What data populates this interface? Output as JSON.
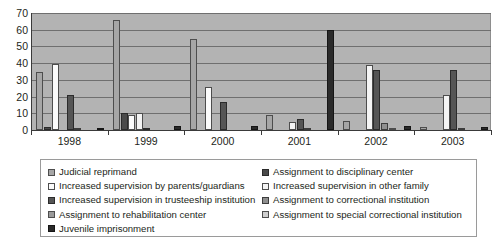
{
  "chart_data": {
    "type": "bar",
    "title": "",
    "subtitle": "",
    "xlabel": "",
    "ylabel": "",
    "ylim": [
      0,
      70
    ],
    "yticks": [
      0,
      10,
      20,
      30,
      40,
      50,
      60,
      70
    ],
    "grid": true,
    "legend_position": "bottom",
    "categories": [
      "1998",
      "1999",
      "2000",
      "2001",
      "2002",
      "2003"
    ],
    "series": [
      {
        "name": "Judicial reprimand",
        "color": "#a6a6a6",
        "values": [
          35,
          66,
          54.5,
          9,
          5.5,
          2
        ]
      },
      {
        "name": "Assignment to disciplinary center",
        "color": "#4a4a4a",
        "values": [
          2,
          10.2,
          0,
          0,
          0,
          0
        ]
      },
      {
        "name": "Increased supervision by parents/guardians",
        "color": "#fbfbfb",
        "values": [
          39.2,
          9,
          25.5,
          0,
          0,
          0
        ]
      },
      {
        "name": "Increased supervision in other family",
        "color": "#f4f4f4",
        "values": [
          0,
          10,
          0,
          5,
          39,
          21
        ]
      },
      {
        "name": "Increased supervision in trusteeship institution",
        "color": "#555555",
        "values": [
          21.2,
          1,
          16.5,
          6.5,
          36,
          36
        ]
      },
      {
        "name": "Assignment to correctional institution",
        "color": "#8f8f8f",
        "values": [
          0.5,
          0,
          0,
          1.5,
          4,
          0.5
        ]
      },
      {
        "name": "Assignment to rehabilitation center",
        "color": "#9a9a9a",
        "values": [
          0,
          0,
          0,
          0,
          1,
          0
        ]
      },
      {
        "name": "Assignment to special correctional institution",
        "color": "#cfcfcf",
        "values": [
          0,
          0,
          0,
          0,
          0,
          0
        ]
      },
      {
        "name": "Juvenile imprisonment",
        "color": "#2a2a2a",
        "values": [
          1,
          2.3,
          2.5,
          60,
          2.5,
          2
        ]
      }
    ],
    "legend_columns": [
      [
        {
          "label": "Judicial reprimand",
          "series": 0
        },
        {
          "label": "Increased supervision by parents/guardians",
          "series": 2
        },
        {
          "label": "Increased supervision in trusteeship institution",
          "series": 4
        },
        {
          "label": "Assignment to rehabilitation center",
          "series": 6
        },
        {
          "label": "Juvenile imprisonment",
          "series": 8
        }
      ],
      [
        {
          "label": "Assignment to disciplinary center",
          "series": 1
        },
        {
          "label": "Increased supervision in other family",
          "series": 3
        },
        {
          "label": "Assignment to correctional institution",
          "series": 5
        },
        {
          "label": "Assignment to special correctional institution",
          "series": 7
        }
      ]
    ]
  }
}
